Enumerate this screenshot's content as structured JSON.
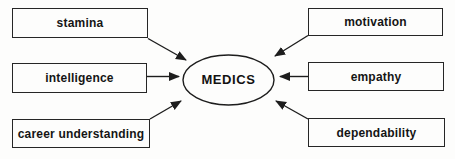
{
  "diagram": {
    "center": {
      "label": "MEDICS"
    },
    "left_factors": [
      {
        "label": "stamina"
      },
      {
        "label": "intelligence"
      },
      {
        "label": "career understanding"
      }
    ],
    "right_factors": [
      {
        "label": "motivation"
      },
      {
        "label": "empathy"
      },
      {
        "label": "dependability"
      }
    ],
    "edges": [
      {
        "from": "stamina",
        "to": "MEDICS"
      },
      {
        "from": "intelligence",
        "to": "MEDICS"
      },
      {
        "from": "career understanding",
        "to": "MEDICS"
      },
      {
        "from": "motivation",
        "to": "MEDICS"
      },
      {
        "from": "empathy",
        "to": "MEDICS"
      },
      {
        "from": "dependability",
        "to": "MEDICS"
      }
    ],
    "colors": {
      "line": "#1d1d1d",
      "box_border": "#262626",
      "text": "#151515",
      "background": "#fdfdfc"
    }
  }
}
